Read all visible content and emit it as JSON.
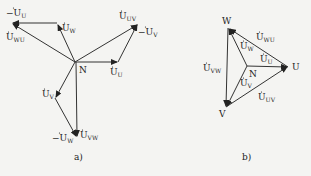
{
  "diagram_a": {
    "caption": "a)",
    "neutral": "N",
    "labels": {
      "neg_u_u": {
        "prefix": "−",
        "base": "U",
        "sub": "U"
      },
      "u_w": {
        "prefix": "",
        "base": "U",
        "sub": "W"
      },
      "u_wu": {
        "prefix": "",
        "base": "U",
        "sub": "WU"
      },
      "u_uv": {
        "prefix": "",
        "base": "U",
        "sub": "UV"
      },
      "neg_u_v": {
        "prefix": "−",
        "base": "U",
        "sub": "V"
      },
      "u_u": {
        "prefix": "",
        "base": "U",
        "sub": "U"
      },
      "u_v": {
        "prefix": "",
        "base": "U",
        "sub": "V"
      },
      "neg_u_w": {
        "prefix": "−",
        "base": "U",
        "sub": "W"
      },
      "u_vw": {
        "prefix": "",
        "base": "U",
        "sub": "VW"
      }
    }
  },
  "diagram_b": {
    "caption": "b)",
    "neutral": "N",
    "vertices": {
      "w": "W",
      "u": "U",
      "v": "V"
    },
    "labels": {
      "u_wu": {
        "base": "U",
        "sub": "WU"
      },
      "u_w": {
        "base": "U",
        "sub": "W"
      },
      "u_u": {
        "base": "U",
        "sub": "U"
      },
      "u_vw": {
        "base": "U",
        "sub": "VW"
      },
      "u_v": {
        "base": "U",
        "sub": "V"
      },
      "u_uv": {
        "base": "U",
        "sub": "UV"
      }
    }
  },
  "colors": {
    "line": "#333333",
    "background": "#f4f4f2",
    "text": "#222222"
  }
}
